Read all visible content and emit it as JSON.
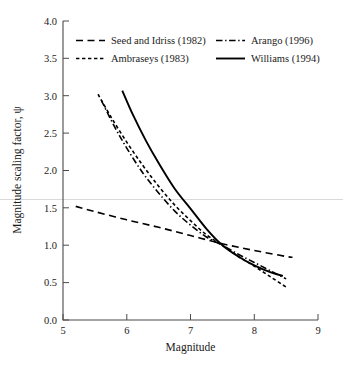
{
  "chart_data": {
    "type": "line",
    "title": "",
    "xlabel": "Magnitude",
    "ylabel": "Magnitude scaling factor, ψ",
    "xlim": [
      5,
      9
    ],
    "ylim": [
      0.0,
      4.0
    ],
    "xticks": [
      "5",
      "6",
      "7",
      "8",
      "9"
    ],
    "yticks": [
      "0.0",
      "0.5",
      "1.0",
      "1.5",
      "2.0",
      "2.5",
      "3.0",
      "3.5",
      "4.0"
    ],
    "grid": false,
    "legend_position": "upper-center",
    "series": [
      {
        "name": "Seed and Idriss (1982)",
        "linestyle": "long-dash",
        "color": "#000000",
        "x": [
          5.2,
          5.5,
          6.0,
          6.5,
          7.0,
          7.5,
          8.0,
          8.5,
          8.6
        ],
        "y": [
          1.52,
          1.45,
          1.34,
          1.24,
          1.13,
          1.02,
          0.93,
          0.85,
          0.84
        ]
      },
      {
        "name": "Ambraseys (1983)",
        "linestyle": "short-dash",
        "color": "#000000",
        "x": [
          5.55,
          5.75,
          6.0,
          6.25,
          6.5,
          6.75,
          7.0,
          7.25,
          7.5,
          7.75,
          8.0,
          8.25,
          8.5
        ],
        "y": [
          3.02,
          2.72,
          2.38,
          2.07,
          1.79,
          1.54,
          1.33,
          1.14,
          1.0,
          0.85,
          0.72,
          0.58,
          0.44
        ]
      },
      {
        "name": "Arango (1996)",
        "linestyle": "dash-dot",
        "color": "#000000",
        "x": [
          5.6,
          5.8,
          6.0,
          6.25,
          6.5,
          6.75,
          7.0,
          7.25,
          7.5,
          7.75,
          8.0,
          8.25,
          8.5
        ],
        "y": [
          2.94,
          2.6,
          2.3,
          1.97,
          1.7,
          1.46,
          1.27,
          1.11,
          1.0,
          0.88,
          0.77,
          0.66,
          0.55
        ]
      },
      {
        "name": "Williams (1994)",
        "linestyle": "solid",
        "color": "#000000",
        "x": [
          5.93,
          6.1,
          6.3,
          6.5,
          6.75,
          7.0,
          7.25,
          7.5,
          7.75,
          8.0,
          8.25,
          8.45
        ],
        "y": [
          3.07,
          2.74,
          2.4,
          2.1,
          1.76,
          1.49,
          1.22,
          1.0,
          0.85,
          0.73,
          0.64,
          0.59
        ]
      }
    ]
  },
  "legend": {
    "entries": [
      {
        "label": "Seed and Idriss (1982)",
        "style": "long-dash"
      },
      {
        "label": "Arango (1996)",
        "style": "dash-dot"
      },
      {
        "label": "Ambraseys (1983)",
        "style": "short-dash"
      },
      {
        "label": "Williams (1994)",
        "style": "solid"
      }
    ]
  }
}
